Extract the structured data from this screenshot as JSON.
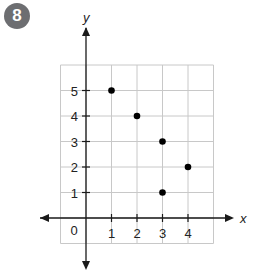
{
  "problem_number": "8",
  "chart_data": {
    "type": "scatter",
    "title": "",
    "xlabel": "x",
    "ylabel": "y",
    "x_ticks": [
      1,
      2,
      3,
      4
    ],
    "y_ticks": [
      1,
      2,
      3,
      4,
      5
    ],
    "origin_label": "0",
    "xlim": [
      -1,
      5
    ],
    "ylim": [
      -1,
      6
    ],
    "grid": true,
    "points": [
      {
        "x": 1,
        "y": 5
      },
      {
        "x": 2,
        "y": 4
      },
      {
        "x": 3,
        "y": 3
      },
      {
        "x": 3,
        "y": 1
      },
      {
        "x": 4,
        "y": 2
      }
    ]
  },
  "colors": {
    "grid": "#c8c8c8",
    "axis": "#1a1a1a",
    "point": "#000000",
    "badge": "#6d6e71"
  }
}
